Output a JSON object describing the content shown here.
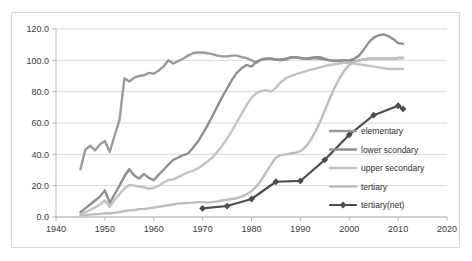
{
  "chart_data": {
    "type": "line",
    "title": "",
    "subtitle": "",
    "xlabel": "",
    "ylabel": "",
    "xlim": [
      1940,
      2020
    ],
    "ylim": [
      0,
      120
    ],
    "xticks": [
      1940,
      1950,
      1960,
      1970,
      1980,
      1990,
      2000,
      2010,
      2020
    ],
    "xtick_labels": [
      "1940",
      "1950",
      "1960",
      "1970",
      "1980",
      "1990",
      "2000",
      "2010",
      "2020"
    ],
    "yticks": [
      0,
      20,
      40,
      60,
      80,
      100,
      120
    ],
    "ytick_labels": [
      "0.0",
      "20.0",
      "40.0",
      "60.0",
      "80.0",
      "100.0",
      "120.0"
    ],
    "grid": "horizontal",
    "legend_position": "inside lower-right",
    "series": [
      {
        "name": "elementary",
        "color": "#9a9a9a",
        "width": 2.4,
        "marker": "none",
        "x": [
          1945,
          1946,
          1947,
          1948,
          1949,
          1950,
          1951,
          1952,
          1953,
          1954,
          1955,
          1956,
          1957,
          1958,
          1959,
          1960,
          1961,
          1962,
          1963,
          1964,
          1965,
          1966,
          1967,
          1968,
          1969,
          1970,
          1971,
          1972,
          1973,
          1974,
          1975,
          1976,
          1977,
          1978,
          1979,
          1980,
          1981,
          1982,
          1983,
          1984,
          1985,
          1986,
          1987,
          1988,
          1989,
          1990,
          1991,
          1992,
          1993,
          1994,
          1995,
          1996,
          1997,
          1998,
          1999,
          2000,
          2001,
          2002,
          2003,
          2004,
          2005,
          2006,
          2007,
          2008,
          2009,
          2010,
          2011
        ],
        "y": [
          30.5,
          43.0,
          45.5,
          42.5,
          46.5,
          48.5,
          41.5,
          52.0,
          62.0,
          88.5,
          86.5,
          89.0,
          90.0,
          90.5,
          92.0,
          91.5,
          93.5,
          96.0,
          100.0,
          98.0,
          99.5,
          101.0,
          103.0,
          104.5,
          105.0,
          105.0,
          104.5,
          104.0,
          103.0,
          102.5,
          102.5,
          103.0,
          103.0,
          102.0,
          101.5,
          100.0,
          98.5,
          100.5,
          101.0,
          101.0,
          100.5,
          100.0,
          100.5,
          101.5,
          102.0,
          101.5,
          101.0,
          101.0,
          101.5,
          101.0,
          100.5,
          100.0,
          100.0,
          100.0,
          100.0,
          99.5,
          99.5,
          100.0,
          100.5,
          101.0,
          101.0,
          101.0,
          101.0,
          101.0,
          101.0,
          101.5,
          101.5
        ]
      },
      {
        "name": "lower scondary",
        "color": "#8f8f8f",
        "width": 2.4,
        "marker": "none",
        "x": [
          1945,
          1946,
          1947,
          1948,
          1949,
          1950,
          1951,
          1952,
          1953,
          1954,
          1955,
          1956,
          1957,
          1958,
          1959,
          1960,
          1961,
          1962,
          1963,
          1964,
          1965,
          1966,
          1967,
          1968,
          1969,
          1970,
          1971,
          1972,
          1973,
          1974,
          1975,
          1976,
          1977,
          1978,
          1979,
          1980,
          1981,
          1982,
          1983,
          1984,
          1985,
          1986,
          1987,
          1988,
          1989,
          1990,
          1991,
          1992,
          1993,
          1994,
          1995,
          1996,
          1997,
          1998,
          1999,
          2000,
          2001,
          2002,
          2003,
          2004,
          2005,
          2006,
          2007,
          2008,
          2009,
          2010,
          2011
        ],
        "y": [
          3.0,
          5.5,
          8.0,
          10.5,
          13.0,
          17.0,
          9.0,
          14.5,
          20.0,
          26.0,
          30.5,
          26.5,
          24.5,
          27.5,
          25.0,
          23.5,
          27.0,
          30.0,
          33.5,
          36.5,
          38.0,
          39.5,
          40.5,
          44.0,
          48.0,
          53.0,
          58.5,
          64.5,
          70.5,
          76.5,
          82.0,
          87.5,
          92.0,
          95.0,
          97.0,
          96.0,
          99.0,
          100.5,
          101.0,
          101.0,
          100.5,
          100.5,
          101.0,
          102.0,
          102.0,
          101.5,
          101.0,
          101.5,
          102.0,
          102.0,
          101.0,
          100.0,
          99.5,
          99.5,
          100.0,
          100.0,
          101.0,
          103.0,
          107.0,
          111.5,
          114.5,
          116.0,
          116.5,
          115.5,
          113.5,
          111.0,
          110.5
        ]
      },
      {
        "name": "upper secondary",
        "color": "#c2c2c2",
        "width": 2.4,
        "marker": "none",
        "x": [
          1945,
          1946,
          1947,
          1948,
          1949,
          1950,
          1951,
          1952,
          1953,
          1954,
          1955,
          1956,
          1957,
          1958,
          1959,
          1960,
          1961,
          1962,
          1963,
          1964,
          1965,
          1966,
          1967,
          1968,
          1969,
          1970,
          1971,
          1972,
          1973,
          1974,
          1975,
          1976,
          1977,
          1978,
          1979,
          1980,
          1981,
          1982,
          1983,
          1984,
          1985,
          1986,
          1987,
          1988,
          1989,
          1990,
          1991,
          1992,
          1993,
          1994,
          1995,
          1996,
          1997,
          1998,
          1999,
          2000,
          2001,
          2002,
          2003,
          2004,
          2005,
          2006,
          2007,
          2008,
          2009,
          2010,
          2011
        ],
        "y": [
          1.5,
          3.0,
          4.5,
          6.0,
          8.0,
          10.5,
          6.5,
          11.0,
          14.5,
          18.0,
          20.5,
          20.0,
          19.5,
          19.0,
          18.0,
          18.5,
          20.0,
          22.0,
          23.5,
          24.0,
          25.5,
          27.0,
          28.5,
          29.5,
          31.0,
          33.0,
          35.5,
          38.0,
          41.5,
          45.5,
          50.0,
          55.0,
          60.5,
          66.0,
          71.5,
          76.0,
          79.0,
          80.5,
          81.0,
          80.0,
          82.5,
          86.0,
          88.5,
          90.0,
          91.0,
          92.0,
          93.0,
          94.0,
          94.5,
          95.5,
          96.5,
          97.0,
          97.5,
          98.0,
          98.5,
          98.5,
          98.0,
          97.5,
          97.0,
          96.5,
          96.0,
          95.5,
          95.0,
          94.5,
          94.5,
          94.5,
          94.5
        ]
      },
      {
        "name": "tertiary",
        "color": "#bdbdbd",
        "width": 2.4,
        "marker": "none",
        "x": [
          1945,
          1946,
          1947,
          1948,
          1949,
          1950,
          1951,
          1952,
          1953,
          1954,
          1955,
          1956,
          1957,
          1958,
          1959,
          1960,
          1961,
          1962,
          1963,
          1964,
          1965,
          1966,
          1967,
          1968,
          1969,
          1970,
          1971,
          1972,
          1973,
          1974,
          1975,
          1976,
          1977,
          1978,
          1979,
          1980,
          1981,
          1982,
          1983,
          1984,
          1985,
          1986,
          1987,
          1988,
          1989,
          1990,
          1991,
          1992,
          1993,
          1994,
          1995,
          1996,
          1997,
          1998,
          1999,
          2000,
          2001,
          2002,
          2003,
          2004,
          2005,
          2006,
          2007,
          2008,
          2009,
          2010,
          2011
        ],
        "y": [
          1.0,
          1.2,
          1.5,
          1.8,
          2.0,
          2.5,
          2.2,
          2.8,
          3.2,
          3.8,
          4.2,
          4.5,
          5.0,
          5.2,
          5.5,
          6.0,
          6.5,
          7.0,
          7.5,
          8.0,
          8.5,
          8.8,
          9.0,
          9.2,
          9.5,
          9.5,
          9.2,
          9.5,
          10.0,
          10.5,
          11.0,
          11.5,
          12.0,
          13.0,
          14.5,
          16.5,
          19.5,
          23.5,
          28.5,
          33.5,
          38.0,
          39.5,
          40.0,
          40.5,
          41.0,
          42.0,
          44.5,
          48.5,
          54.0,
          60.5,
          68.0,
          75.5,
          82.5,
          88.5,
          93.5,
          97.0,
          99.0,
          100.0,
          100.5,
          101.0,
          101.0,
          101.0,
          101.0,
          101.0,
          101.0,
          101.5,
          101.5
        ]
      },
      {
        "name": "tertiary(net)",
        "color": "#4d4d4d",
        "width": 2.2,
        "marker": "diamond",
        "x": [
          1970,
          1975,
          1980,
          1985,
          1990,
          1995,
          2000,
          2005,
          2010,
          2011
        ],
        "y": [
          5.5,
          7.0,
          11.5,
          22.5,
          23.0,
          36.5,
          52.5,
          65.0,
          71.0,
          69.0
        ]
      }
    ]
  },
  "legend": {
    "entries": [
      {
        "label": "elementary"
      },
      {
        "label": "lower scondary"
      },
      {
        "label": "upper secondary"
      },
      {
        "label": "tertiary"
      },
      {
        "label": "tertiary(net)"
      }
    ]
  }
}
